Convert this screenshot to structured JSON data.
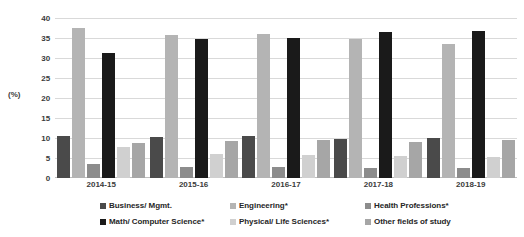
{
  "chart_data": {
    "type": "bar",
    "title": "",
    "xlabel": "",
    "ylabel": "(%)",
    "ylim": [
      0,
      40
    ],
    "ytick_step": 5,
    "grid": true,
    "legend_position": "bottom",
    "categories": [
      "2014-15",
      "2015-16",
      "2016-17",
      "2017-18",
      "2018-19"
    ],
    "yticks": [
      "0",
      "5",
      "10",
      "15",
      "20",
      "25",
      "30",
      "35",
      "40"
    ],
    "series": [
      {
        "name": "Business/ Mgmt.",
        "color": "#4a4a4a",
        "values": [
          10.6,
          10.2,
          10.4,
          9.8,
          9.9
        ]
      },
      {
        "name": "Engineering*",
        "color": "#b4b4b4",
        "values": [
          37.6,
          35.8,
          35.9,
          34.8,
          33.6
        ]
      },
      {
        "name": "Health Professions*",
        "color": "#8c8c8c",
        "values": [
          3.6,
          2.8,
          2.7,
          2.5,
          2.4
        ]
      },
      {
        "name": "Math/ Computer Science*",
        "color": "#1a1a1a",
        "values": [
          31.3,
          34.7,
          35.0,
          36.5,
          36.7
        ]
      },
      {
        "name": "Physical/ Life Sciences*",
        "color": "#d0d0d0",
        "values": [
          7.8,
          6.1,
          5.7,
          5.4,
          5.3
        ]
      },
      {
        "name": "Other fields of study",
        "color": "#a6a6a6",
        "values": [
          8.7,
          9.2,
          9.4,
          9.0,
          9.5
        ]
      }
    ]
  },
  "legend": {
    "rows": [
      [
        "Business/ Mgmt.",
        "Engineering*",
        "Health Professions*"
      ],
      [
        "Math/ Computer Science*",
        "Physical/ Life Sciences*",
        "Other fields of study"
      ]
    ]
  }
}
